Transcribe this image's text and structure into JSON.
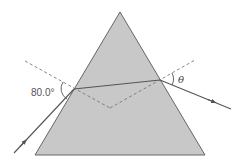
{
  "diagram": {
    "type": "prism-refraction",
    "colors": {
      "prism_fill": "#c8c8c8",
      "prism_stroke": "#666666",
      "ray": "#555555",
      "normal": "#777777",
      "background": "#ffffff"
    },
    "prism": {
      "apex": [
        120,
        12
      ],
      "base_left": [
        35,
        155
      ],
      "base_right": [
        205,
        155
      ]
    },
    "incident_ray": {
      "from": [
        14,
        153
      ],
      "to": [
        74,
        89
      ],
      "arrow_at": [
        24,
        142
      ]
    },
    "internal_ray": {
      "from": [
        74,
        89
      ],
      "to": [
        160,
        80
      ]
    },
    "exit_ray": {
      "from": [
        160,
        80
      ],
      "to": [
        231,
        109
      ],
      "arrow_at": [
        214,
        102
      ]
    },
    "normals": [
      {
        "from": [
          25,
          61
        ],
        "to": [
          110,
          108
        ]
      },
      {
        "from": [
          110,
          108
        ],
        "to": [
          195,
          60
        ]
      }
    ],
    "labels": {
      "incident_angle": "80.0°",
      "exit_angle": "θ"
    }
  }
}
